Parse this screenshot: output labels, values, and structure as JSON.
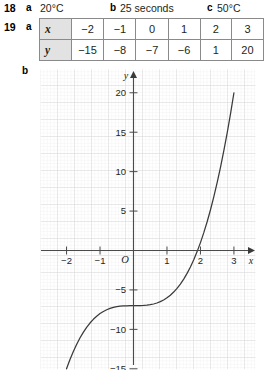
{
  "answers": [
    {
      "number": "18",
      "parts": [
        {
          "letter": "a",
          "text": "20°C"
        },
        {
          "letter": "b",
          "text": "25 seconds"
        },
        {
          "letter": "c",
          "text": "50°C"
        }
      ]
    },
    {
      "number": "19",
      "parts": [
        {
          "letter": "a",
          "text": ""
        },
        {
          "letter": "b",
          "text": ""
        }
      ]
    }
  ],
  "table": {
    "row_headers": [
      "x",
      "y"
    ],
    "x_values": [
      "−2",
      "−1",
      "0",
      "1",
      "2",
      "3"
    ],
    "y_values": [
      "−15",
      "−8",
      "−7",
      "−6",
      "1",
      "20"
    ]
  },
  "chart_data": {
    "type": "line",
    "title": "",
    "xlabel": "x",
    "ylabel": "y",
    "xlim": [
      -2.45,
      3.45
    ],
    "ylim": [
      -16.5,
      22.0
    ],
    "grid": true,
    "minor_grid": true,
    "legend": null,
    "x_ticks": [
      "−2",
      "−1",
      "1",
      "2",
      "3"
    ],
    "x_tick_values": [
      -2,
      -1,
      1,
      2,
      3
    ],
    "y_ticks": [
      "20",
      "15",
      "10",
      "5",
      "−5",
      "−10",
      "−15"
    ],
    "y_tick_values": [
      20,
      15,
      10,
      5,
      -5,
      -10,
      -15
    ],
    "origin_label": "O",
    "equation": "y = x³ − 7",
    "points": {
      "x": [
        -2,
        -1,
        0,
        1,
        2,
        3
      ],
      "y": [
        -15,
        -8,
        -7,
        -6,
        1,
        20
      ]
    },
    "series": [
      {
        "name": "y = x³ − 7",
        "color": "#3a3a3a",
        "x": [
          -2.0,
          -1.9,
          -1.8,
          -1.7,
          -1.6,
          -1.5,
          -1.4,
          -1.3,
          -1.2,
          -1.1,
          -1.0,
          -0.9,
          -0.8,
          -0.7,
          -0.6,
          -0.5,
          -0.4,
          -0.3,
          -0.2,
          -0.1,
          0.0,
          0.1,
          0.2,
          0.3,
          0.4,
          0.5,
          0.6,
          0.7,
          0.8,
          0.9,
          1.0,
          1.1,
          1.2,
          1.3,
          1.4,
          1.5,
          1.6,
          1.7,
          1.8,
          1.9,
          2.0,
          2.1,
          2.2,
          2.3,
          2.4,
          2.5,
          2.6,
          2.7,
          2.8,
          2.9,
          3.0
        ],
        "y": [
          -15.0,
          -13.859,
          -12.832,
          -11.913,
          -11.096,
          -10.375,
          -9.744,
          -9.197,
          -8.728,
          -8.331,
          -8.0,
          -7.729,
          -7.512,
          -7.343,
          -7.216,
          -7.125,
          -7.064,
          -7.027,
          -7.008,
          -7.001,
          -7.0,
          -6.999,
          -6.992,
          -6.973,
          -6.936,
          -6.875,
          -6.784,
          -6.657,
          -6.488,
          -6.271,
          -6.0,
          -5.669,
          -5.272,
          -4.803,
          -4.256,
          -3.625,
          -2.904,
          -2.087,
          -1.168,
          -0.141,
          1.0,
          2.261,
          3.648,
          5.167,
          6.824,
          8.625,
          10.576,
          12.683,
          14.952,
          17.389,
          20.0
        ]
      }
    ]
  }
}
